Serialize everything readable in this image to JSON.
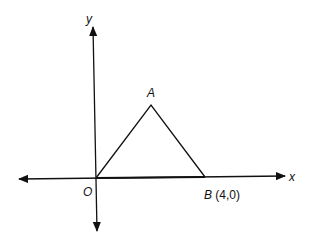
{
  "diagram": {
    "type": "coordinate-geometry",
    "axes": {
      "x_label": "x",
      "y_label": "y",
      "origin_label": "O"
    },
    "points": [
      {
        "name": "A",
        "coords": ""
      },
      {
        "name": "B",
        "coords": "(4,0)"
      }
    ],
    "shape": "triangle OAB",
    "colors": {
      "stroke": "#111111",
      "background": "#ffffff"
    }
  }
}
